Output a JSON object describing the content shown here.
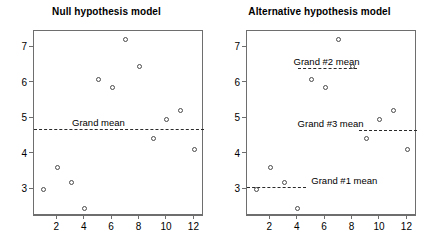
{
  "figure": {
    "width": 426,
    "height": 246,
    "background": "#ffffff"
  },
  "chart_data": {
    "type": "scatter",
    "title": "",
    "panels": [
      {
        "id": "null-model",
        "title": "Null hypothesis model",
        "xlabel": "",
        "ylabel": "",
        "xlim": [
          0.3,
          12.7
        ],
        "ylim": [
          2.25,
          7.45
        ],
        "xticks": [
          2,
          4,
          6,
          8,
          10,
          12
        ],
        "yticks": [
          3,
          4,
          5,
          6,
          7
        ],
        "grid": false,
        "legend": "none",
        "x": [
          1,
          2,
          3,
          4,
          5,
          6,
          7,
          8,
          9,
          10,
          11,
          12
        ],
        "y": [
          3.0,
          3.6,
          3.2,
          2.45,
          6.1,
          5.85,
          7.2,
          6.45,
          4.42,
          4.95,
          5.22,
          4.13
        ],
        "mean_lines": [
          {
            "name": "grand-mean",
            "label": "Grand mean",
            "value": 4.7,
            "x_start": 0.3,
            "x_end": 12.7,
            "label_x": 5.0,
            "style": "dashed"
          }
        ]
      },
      {
        "id": "alternative-model",
        "title": "Alternative hypothesis model",
        "xlabel": "",
        "ylabel": "",
        "xlim": [
          0.3,
          12.7
        ],
        "ylim": [
          2.25,
          7.45
        ],
        "xticks": [
          2,
          4,
          6,
          8,
          10,
          12
        ],
        "yticks": [
          3,
          4,
          5,
          6,
          7
        ],
        "grid": false,
        "legend": "none",
        "x": [
          1,
          2,
          3,
          4,
          5,
          6,
          7,
          8,
          9,
          10,
          11,
          12
        ],
        "y": [
          3.0,
          3.6,
          3.2,
          2.45,
          6.1,
          5.85,
          7.2,
          6.45,
          4.42,
          4.95,
          5.22,
          4.13
        ],
        "mean_lines": [
          {
            "name": "group-1-mean",
            "label": "Grand #1 mean",
            "value": 3.06,
            "x_start": 0.3,
            "x_end": 4.6,
            "label_x": 7.4,
            "style": "dashed"
          },
          {
            "name": "group-2-mean",
            "label": "Grand #2 mean",
            "value": 6.4,
            "x_start": 4.0,
            "x_end": 8.3,
            "label_x": 6.1,
            "style": "dashed"
          },
          {
            "name": "group-3-mean",
            "label": "Grand #3 mean",
            "value": 4.68,
            "x_start": 8.5,
            "x_end": 12.7,
            "label_x": 6.4,
            "style": "dashed"
          }
        ]
      }
    ]
  }
}
